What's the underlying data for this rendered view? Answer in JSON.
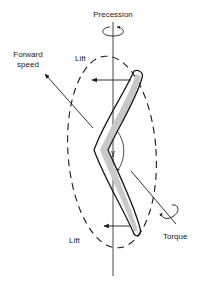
{
  "diagram": {
    "labels": {
      "precession": "Precession",
      "forward_speed_line1": "Forward",
      "forward_speed_line2": "speed",
      "lift_top": "Lift",
      "lift_bottom": "Lift",
      "torque": "Torque"
    },
    "colors": {
      "ink": "#1a1a1a",
      "shade": "#bdbdbd",
      "background": "#ffffff"
    },
    "elements": [
      "vertical-axis",
      "precession-rotation-arrow",
      "dashed-orbit-ellipse",
      "boomerang",
      "lift-arrow-top",
      "lift-arrow-bottom",
      "forward-speed-arrow",
      "torque-axis-with-rotation-arrow",
      "angle-arc"
    ]
  }
}
